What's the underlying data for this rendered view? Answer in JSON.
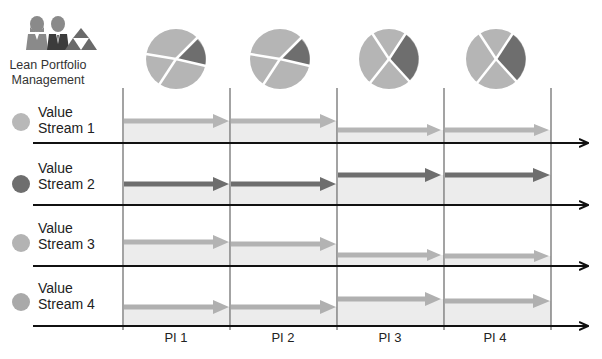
{
  "header": {
    "title_line1": "Lean Portfolio",
    "title_line2": "Management",
    "icon": "people-with-triangles-icon"
  },
  "streams": [
    {
      "label_line1": "Value",
      "label_line2": "Stream 1",
      "color": "#b8b8b8"
    },
    {
      "label_line1": "Value",
      "label_line2": "Stream 2",
      "color": "#6e6e6e"
    },
    {
      "label_line1": "Value",
      "label_line2": "Stream 3",
      "color": "#b3b3b3"
    },
    {
      "label_line1": "Value",
      "label_line2": "Stream 4",
      "color": "#a9a9a9"
    }
  ],
  "increments": [
    {
      "label": "PI 1"
    },
    {
      "label": "PI 2"
    },
    {
      "label": "PI 3"
    },
    {
      "label": "PI 4"
    }
  ],
  "pies": [
    {
      "pi": "PI 1",
      "slices": [
        "large light",
        "small dark",
        "medium light",
        "medium light"
      ]
    },
    {
      "pi": "PI 2",
      "slices": [
        "large light",
        "small dark",
        "medium light",
        "medium light"
      ]
    },
    {
      "pi": "PI 3",
      "slices": [
        "equal quarter light",
        "quarter dark",
        "quarter light",
        "quarter light"
      ]
    },
    {
      "pi": "PI 4",
      "slices": [
        "equal quarter light",
        "quarter dark",
        "quarter light",
        "quarter light"
      ]
    }
  ],
  "colors": {
    "axis": "#111111",
    "grid": "#555555",
    "band": "#ebebeb",
    "dark": "#6e6e6e",
    "light": "#b5b5b5"
  }
}
